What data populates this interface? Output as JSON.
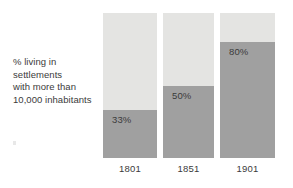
{
  "chart_data": {
    "type": "bar",
    "title": "",
    "subtitle": "",
    "xlabel": "",
    "ylabel": "% living in settlements with more than 10,000 inhabitants",
    "ylim": [
      0,
      100
    ],
    "grid": false,
    "legend": "none",
    "categories": [
      "1801",
      "1851",
      "1901"
    ],
    "values": [
      33,
      50,
      80
    ],
    "value_labels": [
      "33%",
      "50%",
      "80%"
    ],
    "series": [
      {
        "name": "% living in settlements with more than 10,000 inhabitants",
        "values": [
          33,
          50,
          80
        ]
      }
    ],
    "colors": {
      "fill": "#a0a0a0",
      "track": "#e4e4e2",
      "text": "#3b3b3b",
      "background": "#ffffff"
    }
  },
  "caption": {
    "lines": [
      "% living in",
      "settlements",
      "with more than",
      "10,000 inhabitants"
    ]
  }
}
